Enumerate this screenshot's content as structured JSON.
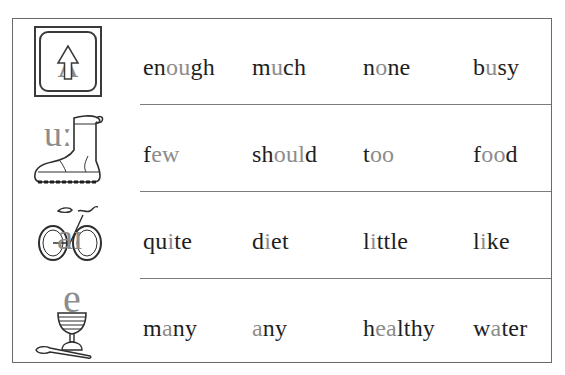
{
  "colors": {
    "text": "#1e1e1e",
    "highlight": "#8c8c8c",
    "rule": "#7c7c7c",
    "frame": "#6a6a6a"
  },
  "rows": [
    {
      "icon": "up-arrow-key-icon",
      "symbol": "ʌ",
      "words": [
        {
          "text": "enough",
          "parts": [
            {
              "t": "en",
              "h": false
            },
            {
              "t": "ou",
              "h": true
            },
            {
              "t": "gh",
              "h": false
            }
          ]
        },
        {
          "text": "much",
          "parts": [
            {
              "t": "m",
              "h": false
            },
            {
              "t": "u",
              "h": true
            },
            {
              "t": "ch",
              "h": false
            }
          ]
        },
        {
          "text": "none",
          "parts": [
            {
              "t": "n",
              "h": false
            },
            {
              "t": "o",
              "h": true
            },
            {
              "t": "ne",
              "h": false
            }
          ]
        },
        {
          "text": "busy",
          "parts": [
            {
              "t": "b",
              "h": false
            },
            {
              "t": "u",
              "h": true
            },
            {
              "t": "sy",
              "h": false
            }
          ]
        }
      ]
    },
    {
      "icon": "boot-icon",
      "symbol": "uː",
      "words": [
        {
          "text": "few",
          "parts": [
            {
              "t": "f",
              "h": false
            },
            {
              "t": "ew",
              "h": true
            }
          ]
        },
        {
          "text": "should",
          "parts": [
            {
              "t": "sh",
              "h": false
            },
            {
              "t": "oul",
              "h": true
            },
            {
              "t": "d",
              "h": false
            }
          ]
        },
        {
          "text": "too",
          "parts": [
            {
              "t": "t",
              "h": false
            },
            {
              "t": "oo",
              "h": true
            }
          ]
        },
        {
          "text": "food",
          "parts": [
            {
              "t": "f",
              "h": false
            },
            {
              "t": "oo",
              "h": true
            },
            {
              "t": "d",
              "h": false
            }
          ]
        }
      ]
    },
    {
      "icon": "bicycle-icon",
      "symbol": "aɪ",
      "words": [
        {
          "text": "quite",
          "parts": [
            {
              "t": "qu",
              "h": false
            },
            {
              "t": "i",
              "h": true
            },
            {
              "t": "te",
              "h": false
            }
          ]
        },
        {
          "text": "diet",
          "parts": [
            {
              "t": "d",
              "h": false
            },
            {
              "t": "i",
              "h": true
            },
            {
              "t": "et",
              "h": false
            }
          ]
        },
        {
          "text": "little",
          "parts": [
            {
              "t": "l",
              "h": false
            },
            {
              "t": "i",
              "h": true
            },
            {
              "t": "ttle",
              "h": false
            }
          ]
        },
        {
          "text": "like",
          "parts": [
            {
              "t": "l",
              "h": false
            },
            {
              "t": "i",
              "h": true
            },
            {
              "t": "ke",
              "h": false
            }
          ]
        }
      ]
    },
    {
      "icon": "egg-cup-icon",
      "symbol": "e",
      "words": [
        {
          "text": "many",
          "parts": [
            {
              "t": "m",
              "h": false
            },
            {
              "t": "a",
              "h": true
            },
            {
              "t": "ny",
              "h": false
            }
          ]
        },
        {
          "text": "any",
          "parts": [
            {
              "t": "a",
              "h": true
            },
            {
              "t": "ny",
              "h": false
            }
          ]
        },
        {
          "text": "healthy",
          "parts": [
            {
              "t": "h",
              "h": false
            },
            {
              "t": "ea",
              "h": true
            },
            {
              "t": "lthy",
              "h": false
            }
          ]
        },
        {
          "text": "water",
          "parts": [
            {
              "t": "w",
              "h": false
            },
            {
              "t": "a",
              "h": true
            },
            {
              "t": "ter",
              "h": false
            }
          ]
        }
      ]
    }
  ]
}
